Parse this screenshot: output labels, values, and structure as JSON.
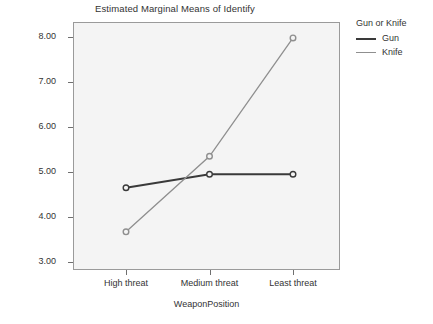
{
  "chart_data": {
    "type": "line",
    "title": "Estimated Marginal Means of Identify",
    "xlabel": "WeaponPosition",
    "ylabel": "Estimated Marginal Means",
    "categories": [
      "High threat",
      "Medium threat",
      "Least threat"
    ],
    "ylim": [
      3.0,
      8.0
    ],
    "yticks": [
      "3.00",
      "4.00",
      "5.00",
      "6.00",
      "7.00",
      "8.00"
    ],
    "ytick_values": [
      3.0,
      4.0,
      5.0,
      6.0,
      7.0,
      8.0
    ],
    "grid": false,
    "legend_position": "right",
    "legend_title": "Gun or Knife",
    "series": [
      {
        "name": "Gun",
        "values": [
          4.65,
          4.95,
          4.95
        ],
        "color": "#3a3a3a",
        "marker": "circle"
      },
      {
        "name": "Knife",
        "values": [
          3.67,
          5.35,
          7.98
        ],
        "color": "#8f8f8f",
        "marker": "circle"
      }
    ]
  },
  "legend": {
    "title": "Gun or Knife",
    "items": [
      {
        "label": "Gun",
        "color": "#3a3a3a"
      },
      {
        "label": "Knife",
        "color": "#8f8f8f"
      }
    ]
  },
  "colors": {
    "plot_background": "#f4f4f4",
    "frame": "#9a9a9a",
    "text": "#333333",
    "gun_line": "#3a3a3a",
    "knife_line": "#8f8f8f"
  }
}
